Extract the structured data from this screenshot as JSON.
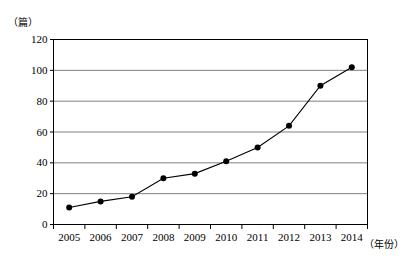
{
  "chart_data": {
    "type": "line",
    "title": "",
    "xlabel": "年份",
    "ylabel": "篇",
    "x_unit_label": "（年份）",
    "y_unit_label": "（篇）",
    "categories": [
      "2005",
      "2006",
      "2007",
      "2008",
      "2009",
      "2010",
      "2011",
      "2012",
      "2013",
      "2014"
    ],
    "values": [
      11,
      15,
      18,
      30,
      33,
      41,
      50,
      64,
      90,
      102
    ],
    "series": [
      {
        "name": "",
        "values": [
          11,
          15,
          18,
          30,
          33,
          41,
          50,
          64,
          90,
          102
        ]
      }
    ],
    "ylim": [
      0,
      120
    ],
    "yticks": [
      0,
      20,
      40,
      60,
      80,
      100,
      120
    ],
    "ytick_labels": [
      "0",
      "20",
      "40",
      "60",
      "80",
      "100",
      "120"
    ],
    "xtick_labels": [
      "2005",
      "2006",
      "2007",
      "2008",
      "2009",
      "2010",
      "2011",
      "2012",
      "2013",
      "2014"
    ],
    "grid": "horizontal",
    "legend": "none",
    "marker": "filled-circle",
    "line_color": "#000000",
    "marker_color": "#000000",
    "grid_color": "#808080",
    "frame_color": "#000000",
    "background_color": "#ffffff"
  }
}
